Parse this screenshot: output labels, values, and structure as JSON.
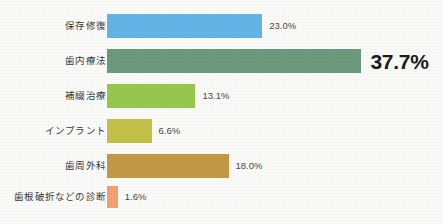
{
  "chart_data": {
    "type": "bar",
    "orientation": "horizontal",
    "title": "",
    "xlabel": "",
    "ylabel": "",
    "grid": false,
    "legend": "none",
    "xlim": [
      0,
      37.7
    ],
    "value_suffix": "%",
    "categories": [
      "保存修復",
      "歯内療法",
      "補綴治療",
      "インプラント",
      "歯周外科",
      "歯根破折などの診断"
    ],
    "values": [
      23.0,
      37.7,
      13.1,
      6.6,
      18.0,
      1.6
    ],
    "value_labels": [
      "23.0%",
      "37.7%",
      "13.1%",
      "6.6%",
      "18.0%",
      "1.6%"
    ],
    "colors": [
      "#64b5e8",
      "#6d9b7d",
      "#97c94f",
      "#c3c247",
      "#c59a47",
      "#f5a濃"
    ],
    "bars": [
      {
        "label": "保存修復",
        "value": 23.0,
        "value_label": "23.0%",
        "color": "#64b5e8",
        "emphasis": false
      },
      {
        "label": "歯内療法",
        "value": 37.7,
        "value_label": "37.7%",
        "color": "#6d9b7d",
        "emphasis": true
      },
      {
        "label": "補綴治療",
        "value": 13.1,
        "value_label": "13.1%",
        "color": "#97c94f",
        "emphasis": false
      },
      {
        "label": "インプラント",
        "value": 6.6,
        "value_label": "6.6%",
        "color": "#c3c247",
        "emphasis": false
      },
      {
        "label": "歯周外科",
        "value": 18.0,
        "value_label": "18.0%",
        "color": "#c59a47",
        "emphasis": false
      },
      {
        "label": "歯根破折などの診断",
        "value": 1.6,
        "value_label": "1.6%",
        "color": "#f7a072",
        "emphasis": false
      }
    ],
    "layout": {
      "px_per_percent": 6.75,
      "bar_height": 24,
      "row_tops": [
        14,
        49,
        84,
        119,
        154,
        186
      ],
      "baseline_x": 107
    }
  }
}
